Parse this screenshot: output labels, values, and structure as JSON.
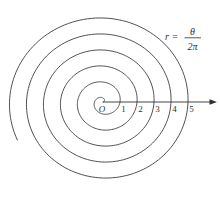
{
  "figure": {
    "equation": {
      "lhs": "r =",
      "numerator": "θ",
      "denominator": "2π",
      "as_text": "r = θ/(2π)"
    },
    "origin_label": "O",
    "axis_tick_labels": [
      "1",
      "2",
      "3",
      "4",
      "5"
    ]
  },
  "chart_data": {
    "type": "line",
    "subtype": "polar-archimedean-spiral",
    "equation": "r = θ/(2π)",
    "theta_range_turns": [
      0,
      5.57
    ],
    "turns_visible": 5.57,
    "x_axis_ticks": [
      1,
      2,
      3,
      4,
      5
    ],
    "positive_x_axis_crossings_r": [
      1,
      2,
      3,
      4,
      5
    ],
    "origin_label": "O",
    "grid": "off",
    "legend": "none",
    "line_color": "#3d3d3d",
    "layout": {
      "cx": 103,
      "cy": 102,
      "unit_x": 17,
      "unit_y": 16,
      "axis_start_x": 103,
      "axis_tip_x": 217,
      "tick_label_baseline_y": 112,
      "tick_label_offset_x": 3.5
    }
  }
}
